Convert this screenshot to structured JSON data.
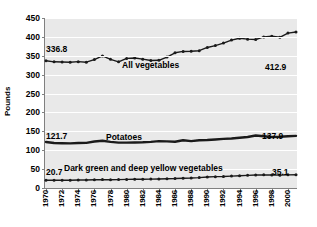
{
  "chart_data": {
    "type": "line",
    "title": "",
    "xlabel": "",
    "ylabel": "Pounds",
    "ylim": [
      0,
      450
    ],
    "ytick_values": [
      0,
      50,
      100,
      150,
      200,
      250,
      300,
      350,
      400,
      450
    ],
    "ytick_labels": [
      "0",
      "50",
      "100",
      "150",
      "200",
      "250",
      "300",
      "350",
      "400",
      "450"
    ],
    "grid": true,
    "legend_position": "inline-labels",
    "x": [
      1970,
      1971,
      1972,
      1973,
      1974,
      1975,
      1976,
      1977,
      1978,
      1979,
      1980,
      1981,
      1982,
      1983,
      1984,
      1985,
      1986,
      1987,
      1988,
      1989,
      1990,
      1991,
      1992,
      1993,
      1994,
      1995,
      1996,
      1997,
      1998,
      1999,
      2000,
      2001
    ],
    "xtick_labels": [
      "1970",
      "1972",
      "1974",
      "1976",
      "1978",
      "1980",
      "1982",
      "1984",
      "1986",
      "1988",
      "1990",
      "1992",
      "1994",
      "1996",
      "1998",
      "2000"
    ],
    "series": [
      {
        "name": "All vegetables",
        "markers": true,
        "start_label": "336.8",
        "end_label": "412.9",
        "values": [
          336.8,
          334.0,
          333.5,
          333.0,
          334.5,
          333.0,
          340.0,
          349.5,
          340.5,
          334.0,
          343.0,
          344.0,
          341.0,
          337.5,
          338.0,
          346.5,
          358.0,
          361.5,
          362.0,
          363.5,
          372.0,
          377.0,
          383.5,
          391.5,
          396.5,
          394.0,
          393.0,
          400.0,
          401.5,
          399.0,
          410.0,
          412.9
        ]
      },
      {
        "name": "Potatoes",
        "markers": false,
        "start_label": "121.7",
        "end_label": "137.9",
        "values": [
          121.7,
          119.0,
          118.5,
          118.0,
          119.0,
          119.5,
          123.0,
          125.0,
          122.0,
          120.0,
          120.0,
          120.5,
          121.0,
          122.0,
          124.0,
          123.5,
          122.5,
          126.5,
          124.0,
          126.5,
          127.0,
          128.5,
          130.0,
          131.0,
          133.0,
          135.0,
          139.0,
          137.0,
          135.0,
          135.5,
          137.0,
          137.9
        ]
      },
      {
        "name": "Dark green and deep yellow vegetables",
        "markers": true,
        "start_label": "20.7",
        "end_label": "35.1",
        "values": [
          20.7,
          20.5,
          20.8,
          20.6,
          21.0,
          21.2,
          22.0,
          22.3,
          22.0,
          22.3,
          22.8,
          23.0,
          23.2,
          23.5,
          24.0,
          24.5,
          25.0,
          26.0,
          26.5,
          27.5,
          29.0,
          30.0,
          30.5,
          31.5,
          32.5,
          33.5,
          34.5,
          34.8,
          34.5,
          34.0,
          34.8,
          35.1
        ]
      }
    ]
  },
  "axis": {
    "y_title": "Pounds"
  },
  "colors": {
    "plot_background": "#e9e9e9",
    "gridline": "#ffffff",
    "axis": "#808080",
    "line": "#1a1a1a",
    "text": "#000000"
  }
}
